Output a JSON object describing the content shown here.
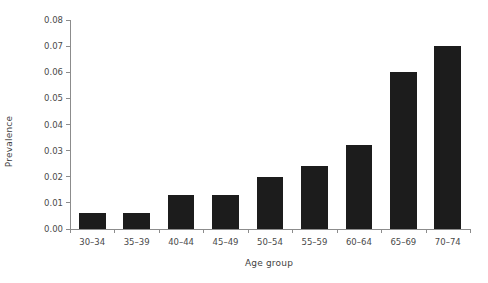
{
  "chart_data": {
    "type": "bar",
    "title": "",
    "subtitle": "",
    "xlabel": "Age group",
    "ylabel": "Prevalence",
    "categories": [
      "30–34",
      "35–39",
      "40–44",
      "45–49",
      "50–54",
      "55–59",
      "60–64",
      "65–69",
      "70–74"
    ],
    "values": [
      0.006,
      0.006,
      0.013,
      0.013,
      0.02,
      0.024,
      0.032,
      0.06,
      0.07
    ],
    "ylim": [
      0.0,
      0.08
    ],
    "yticks": [
      "0.00",
      "0.01",
      "0.02",
      "0.03",
      "0.04",
      "0.05",
      "0.06",
      "0.07",
      "0.08"
    ],
    "ytick_values": [
      0.0,
      0.01,
      0.02,
      0.03,
      0.04,
      0.05,
      0.06,
      0.07,
      0.08
    ],
    "grid": false,
    "legend": null,
    "legend_position": "none",
    "bar_color": "#1c1c1c",
    "axis_color": "#8c8c8c",
    "background": "#ffffff"
  }
}
